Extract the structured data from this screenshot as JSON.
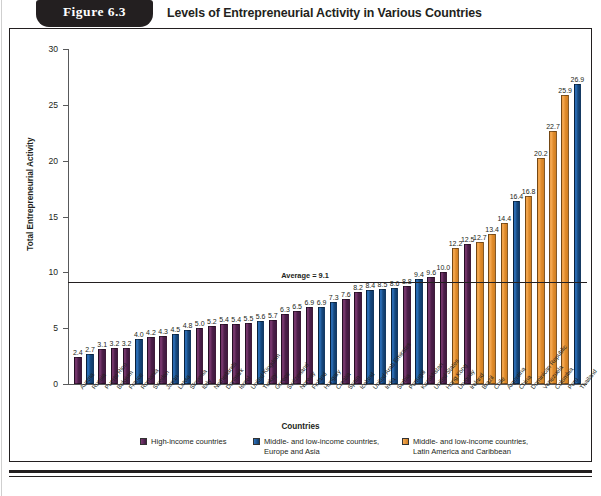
{
  "header": {
    "figure_tab_label": "Figure  6.3",
    "title": "Levels of Entrepreneurial Activity in Various Countries"
  },
  "axes": {
    "y_title": "Total Entrepreneurial Activity",
    "x_title": "Countries",
    "y_ticks": [
      "0",
      "5",
      "10",
      "15",
      "20",
      "25",
      "30"
    ]
  },
  "annotation": {
    "average_label": "Average = 9.1",
    "average_value": 9.1
  },
  "legend": {
    "items": [
      {
        "label": "High-income countries",
        "color": "#5c2757",
        "key": "high"
      },
      {
        "label": "Middle- and low-income countries,\nEurope and Asia",
        "color": "#1b5494",
        "key": "midea"
      },
      {
        "label": "Middle- and low-income countries,\nLatin America and Caribbean",
        "color": "#ee9c41",
        "key": "midlac"
      }
    ]
  },
  "chart_data": {
    "type": "bar",
    "title": "Levels of Entrepreneurial Activity in Various Countries",
    "xlabel": "Countries",
    "ylabel": "Total Entrepreneurial Activity",
    "ylim": [
      0,
      30
    ],
    "ytick_step": 5,
    "grid": false,
    "legend_position": "bottom",
    "annotations": [
      {
        "type": "hline",
        "value": 9.1,
        "label": "Average = 9.1"
      }
    ],
    "group_colors": {
      "high": "#5c2757",
      "midea": "#1b5494",
      "midlac": "#ee9c41"
    },
    "categories": [
      "Austria",
      "Russia",
      "Puerto Rico",
      "Belgium",
      "France",
      "Romania",
      "Sweden",
      "Japan",
      "Latvia",
      "Slovenia",
      "Italy",
      "Netherlands",
      "Denmark",
      "Israel",
      "United Kingdom",
      "Turkey",
      "Greece",
      "Switzerland",
      "Norway",
      "Finland",
      "Hungary",
      "Croatia",
      "Spain",
      "Iceland",
      "United Arab Emirates",
      "India",
      "Serbia",
      "Portugal",
      "Kazakhstan",
      "United States",
      "Hong Kong",
      "Uruguay",
      "Ireland",
      "Brazil",
      "Chile",
      "Argentina",
      "China",
      "Dominican Republic",
      "Venezuela",
      "Colombia",
      "Peru",
      "Thailand"
    ],
    "values": [
      2.4,
      2.7,
      3.1,
      3.2,
      3.2,
      4.0,
      4.2,
      4.3,
      4.5,
      4.8,
      5.0,
      5.2,
      5.4,
      5.4,
      5.5,
      5.6,
      5.7,
      6.3,
      6.5,
      6.9,
      6.9,
      7.3,
      7.6,
      8.2,
      8.4,
      8.5,
      8.6,
      8.8,
      9.4,
      9.6,
      10.0,
      12.2,
      12.5,
      12.7,
      13.4,
      14.4,
      16.4,
      16.8,
      20.2,
      22.7,
      25.9,
      26.9
    ],
    "groups": [
      "high",
      "midea",
      "high",
      "high",
      "high",
      "midea",
      "high",
      "high",
      "midea",
      "midea",
      "high",
      "high",
      "high",
      "high",
      "high",
      "midea",
      "high",
      "high",
      "high",
      "high",
      "midea",
      "midea",
      "high",
      "high",
      "midea",
      "midea",
      "midea",
      "high",
      "midea",
      "high",
      "high",
      "midlac",
      "high",
      "midlac",
      "midlac",
      "midlac",
      "midea",
      "midlac",
      "midlac",
      "midlac",
      "midlac",
      "midea"
    ]
  }
}
